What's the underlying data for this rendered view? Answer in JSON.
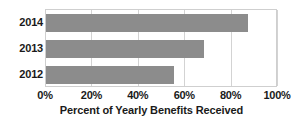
{
  "chart_data": {
    "type": "bar",
    "orientation": "horizontal",
    "title": "",
    "xlabel": "Percent of Yearly Benefits Received",
    "ylabel": "",
    "categories": [
      "2014",
      "2013",
      "2012"
    ],
    "values": [
      87,
      68,
      55
    ],
    "series": [
      {
        "name": "Percent of Yearly Benefits Received",
        "values": [
          87,
          68,
          55
        ]
      }
    ],
    "xlim": [
      0,
      100
    ],
    "xticks": [
      0,
      20,
      40,
      60,
      80,
      100
    ],
    "xticklabels": [
      "0%",
      "20%",
      "40%",
      "60%",
      "80%",
      "100%"
    ],
    "grid": true,
    "grid_axis": "x",
    "legend": false,
    "bar_color": "#8c8c8c",
    "gridline_color": "#d3d3d3",
    "plot_border_color": "#cfcfcf",
    "text_color": "#1a1a1a",
    "background": "#ffffff"
  },
  "axis": {
    "x_title": "Percent of Yearly Benefits Received"
  },
  "ticks": [
    {
      "label": "0%",
      "value": 0
    },
    {
      "label": "20%",
      "value": 20
    },
    {
      "label": "40%",
      "value": 40
    },
    {
      "label": "60%",
      "value": 60
    },
    {
      "label": "80%",
      "value": 80
    },
    {
      "label": "100%",
      "value": 100
    }
  ],
  "bars": [
    {
      "label": "2014",
      "value": 87
    },
    {
      "label": "2013",
      "value": 68
    },
    {
      "label": "2012",
      "value": 55
    }
  ]
}
